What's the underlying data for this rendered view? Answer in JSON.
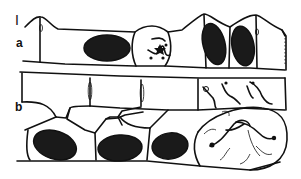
{
  "figure": {
    "labels": {
      "figure_number": "I",
      "panel_a": "a",
      "panel_b": "b"
    },
    "colors": {
      "ink": "#111111",
      "background": "#ffffff",
      "nucleus_fill": "#1a1a1a"
    }
  }
}
